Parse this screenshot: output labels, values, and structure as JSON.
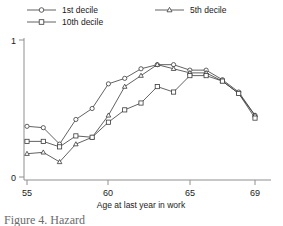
{
  "figure": {
    "caption_partial": "Figure 4. Hazard",
    "axis": {
      "x_title": "Age at last year in work",
      "x_ticks": [
        "55",
        "60",
        "65",
        "69"
      ],
      "y_ticks": [
        "0",
        "1"
      ]
    },
    "legend": [
      {
        "label": "1st decile",
        "marker": "circle"
      },
      {
        "label": "10th decile",
        "marker": "square"
      },
      {
        "label": "5th decile",
        "marker": "triangle"
      }
    ]
  },
  "chart_data": {
    "type": "line",
    "title": "",
    "subtitle": "",
    "xlabel": "Age at last year in work",
    "ylabel": "",
    "xlim": [
      55,
      69
    ],
    "ylim": [
      0,
      1
    ],
    "grid": false,
    "legend_position": "top",
    "x": [
      55,
      56,
      57,
      58,
      59,
      60,
      61,
      62,
      63,
      64,
      65,
      66,
      67,
      68,
      69
    ],
    "series": [
      {
        "name": "1st decile",
        "marker": "circle",
        "values": [
          0.37,
          0.36,
          0.24,
          0.42,
          0.5,
          0.68,
          0.72,
          0.79,
          0.82,
          0.82,
          0.78,
          0.78,
          0.71,
          0.62,
          0.45
        ]
      },
      {
        "name": "5th decile",
        "marker": "triangle",
        "values": [
          0.17,
          0.18,
          0.11,
          0.24,
          0.29,
          0.45,
          0.66,
          0.74,
          0.82,
          0.79,
          0.76,
          0.76,
          0.7,
          0.61,
          0.45
        ]
      },
      {
        "name": "10th decile",
        "marker": "square",
        "values": [
          0.26,
          0.26,
          0.22,
          0.3,
          0.29,
          0.4,
          0.49,
          0.54,
          0.66,
          0.62,
          0.74,
          0.74,
          0.7,
          0.61,
          0.43
        ]
      }
    ]
  }
}
